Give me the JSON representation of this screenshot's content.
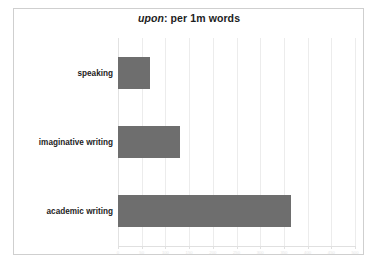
{
  "chart_data": {
    "type": "bar",
    "orientation": "horizontal",
    "title": "upon: per 1m words",
    "title_italic_part": "upon",
    "title_rest": ": per 1m words",
    "categories": [
      "speaking",
      "imaginative writing",
      "academic writing"
    ],
    "values": [
      68,
      130,
      365
    ],
    "series": [
      {
        "name": "per 1m words",
        "values": [
          68,
          130,
          365
        ]
      }
    ],
    "xlabel": "",
    "ylabel": "",
    "xlim": [
      0,
      500
    ],
    "ylim": null,
    "xticks": [
      0,
      50,
      100,
      150,
      200,
      250,
      300,
      350,
      400,
      450,
      500
    ],
    "xticklabels": [
      "0",
      "50",
      "100",
      "150",
      "200",
      "250",
      "300",
      "350",
      "400",
      "450",
      "500"
    ],
    "grid": true,
    "grid_axis": "x",
    "legend": false,
    "legend_position": "none",
    "bar_color": "#6e6e6e",
    "gridline_color": "#ececec",
    "frame_color": "#cfcfcf",
    "background_color": "#ffffff",
    "tick_label_color": "#e6e6e6",
    "title_color": "#1d1d1d",
    "category_label_color": "#1d1d1d"
  }
}
